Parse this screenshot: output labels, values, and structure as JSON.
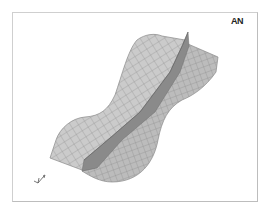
{
  "window": {
    "logo_text": "AN",
    "background": "#ffffff",
    "border_color": "#cfcfcf"
  },
  "plot": {
    "type": "3d-surface-mesh",
    "mesh_fill": "#c9c9c9",
    "mesh_line": "#8a8a8a",
    "ridge_fill": "#7d7d7d",
    "triad_icon": "xyz-triad-icon"
  }
}
